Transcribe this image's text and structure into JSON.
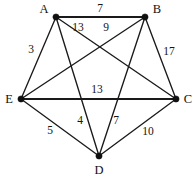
{
  "chart_data": {
    "type": "diagram",
    "title": "",
    "graph_kind": "complete-weighted-undirected-graph",
    "vertex_count": 5,
    "edge_count": 10,
    "vertices": [
      {
        "id": "A",
        "label": "A",
        "x": 56,
        "y": 17,
        "label_x": 44,
        "label_y": 10
      },
      {
        "id": "B",
        "label": "B",
        "x": 145,
        "y": 17,
        "label_x": 157,
        "label_y": 10
      },
      {
        "id": "C",
        "label": "C",
        "x": 176,
        "y": 99,
        "label_x": 188,
        "label_y": 100
      },
      {
        "id": "D",
        "label": "D",
        "x": 99,
        "y": 156,
        "label_x": 99,
        "label_y": 171
      },
      {
        "id": "E",
        "label": "E",
        "x": 21,
        "y": 99,
        "label_x": 9,
        "label_y": 100
      }
    ],
    "edges": [
      {
        "from": "A",
        "to": "B",
        "weight": 7,
        "label_x": 100,
        "label_y": 9,
        "thick": true
      },
      {
        "from": "A",
        "to": "C",
        "weight": 13,
        "label_x": 78,
        "label_y": 28,
        "thick": false
      },
      {
        "from": "A",
        "to": "D",
        "weight": null,
        "label_x": null,
        "label_y": null,
        "thick": false
      },
      {
        "from": "A",
        "to": "E",
        "weight": 3,
        "label_x": 31,
        "label_y": 50,
        "thick": false
      },
      {
        "from": "B",
        "to": "C",
        "weight": 17,
        "label_x": 169,
        "label_y": 52,
        "thick": false
      },
      {
        "from": "B",
        "to": "D",
        "weight": null,
        "label_x": null,
        "label_y": null,
        "thick": false
      },
      {
        "from": "B",
        "to": "E",
        "weight": 9,
        "label_x": 106,
        "label_y": 28,
        "thick": false
      },
      {
        "from": "C",
        "to": "D",
        "weight": 10,
        "label_x": 148,
        "label_y": 132,
        "thick": false
      },
      {
        "from": "C",
        "to": "E",
        "weight": 13,
        "label_x": 97,
        "label_y": 90,
        "thick": true
      },
      {
        "from": "D",
        "to": "E",
        "weight": 5,
        "label_x": 50,
        "label_y": 131,
        "thick": false
      }
    ],
    "extra_weight_labels": [
      {
        "value": 4,
        "x": 80,
        "y": 121,
        "belongs_to": "A-D"
      },
      {
        "value": 7,
        "x": 116,
        "y": 121,
        "belongs_to": "B-D"
      }
    ],
    "all_weights": [
      7,
      13,
      9,
      3,
      17,
      13,
      4,
      7,
      5,
      10
    ],
    "colors": {
      "background": "#ffffff",
      "edge": "#1a1a1a",
      "vertex": "#101010",
      "text": "#111111"
    }
  }
}
